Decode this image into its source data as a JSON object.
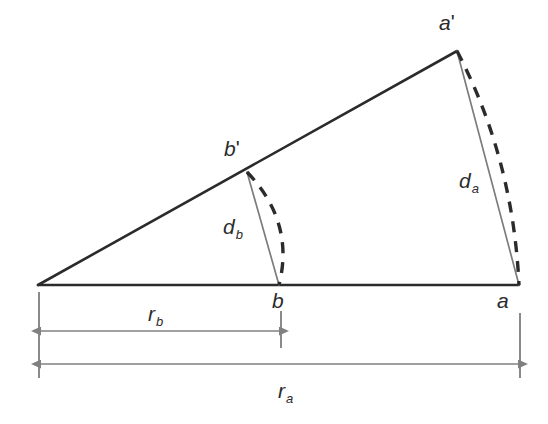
{
  "figure": {
    "background_color": "#ffffff",
    "width": 548,
    "height": 424
  },
  "colors": {
    "solid_dark": "#2b2b2b",
    "chord_gray": "#7c7c7c",
    "dimension_gray": "#808080",
    "tick_gray": "#8a8a8a",
    "text": "#2b2b2b"
  },
  "points": {
    "origin": {
      "name": "origin",
      "x": 38,
      "y": 285
    },
    "a": {
      "label": "a",
      "x": 519,
      "y": 285,
      "label_x": 497,
      "label_y": 290
    },
    "b": {
      "label": "b",
      "x": 279,
      "y": 285,
      "label_x": 272,
      "label_y": 290
    },
    "a_prime": {
      "label_base": "a",
      "label_prime": "'",
      "x": 457,
      "y": 51,
      "label_x": 439,
      "label_y": 12
    },
    "b_prime": {
      "label_base": "b",
      "label_prime": "'",
      "x": 247,
      "y": 172,
      "label_x": 224,
      "label_y": 138
    }
  },
  "segments": {
    "baseline": {
      "name": "baseline",
      "x1": 38,
      "y1": 285,
      "x2": 519,
      "y2": 285
    },
    "hypotenuse": {
      "name": "hypotenuse",
      "x1": 38,
      "y1": 285,
      "x2": 457,
      "y2": 51
    },
    "chord_da": {
      "name": "chord-da",
      "x1": 457,
      "y1": 51,
      "x2": 519,
      "y2": 285
    },
    "chord_db": {
      "name": "chord-db",
      "x1": 247,
      "y1": 172,
      "x2": 279,
      "y2": 285
    }
  },
  "arcs": {
    "arc_a": {
      "name": "arc-a",
      "start_x": 457,
      "start_y": 51,
      "end_x": 519,
      "end_y": 285,
      "ctrl_x": 513,
      "ctrl_y": 158
    },
    "arc_b": {
      "name": "arc-b",
      "start_x": 247,
      "start_y": 172,
      "end_x": 279,
      "end_y": 285,
      "ctrl_x": 295,
      "ctrl_y": 222
    }
  },
  "distance_labels": {
    "d_a": {
      "base": "d",
      "sub": "a",
      "x": 459,
      "y": 170
    },
    "d_b": {
      "base": "d",
      "sub": "b",
      "x": 223,
      "y": 216
    }
  },
  "dimensions": {
    "r_b": {
      "label_base": "r",
      "label_sub": "b",
      "label_x": 148,
      "label_y": 303,
      "arrow_y": 331,
      "x_start": 41,
      "x_end": 279
    },
    "r_a": {
      "label_base": "r",
      "label_sub": "a",
      "label_x": 278,
      "label_y": 380,
      "arrow_y": 364,
      "x_start": 41,
      "x_end": 518
    },
    "ticks": [
      {
        "name": "tick-origin",
        "x": 39,
        "y1": 292,
        "y2": 378
      },
      {
        "name": "tick-b",
        "x": 281,
        "y1": 311,
        "y2": 348
      },
      {
        "name": "tick-a",
        "x": 520,
        "y1": 313,
        "y2": 378
      }
    ]
  }
}
